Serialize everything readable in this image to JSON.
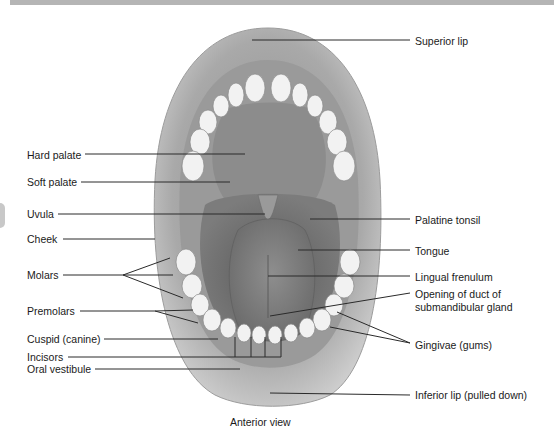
{
  "figure": {
    "caption": "Anterior view"
  },
  "labels_left": [
    {
      "id": "hard-palate",
      "text": "Hard palate"
    },
    {
      "id": "soft-palate",
      "text": "Soft palate"
    },
    {
      "id": "uvula",
      "text": "Uvula"
    },
    {
      "id": "cheek",
      "text": "Cheek"
    },
    {
      "id": "molars",
      "text": "Molars"
    },
    {
      "id": "premolars",
      "text": "Premolars"
    },
    {
      "id": "cuspid",
      "text": "Cuspid (canine)"
    },
    {
      "id": "incisors",
      "text": "Incisors"
    },
    {
      "id": "oral-vestibule",
      "text": "Oral vestibule"
    }
  ],
  "labels_right": [
    {
      "id": "superior-lip",
      "text": "Superior lip"
    },
    {
      "id": "palatine-tonsil",
      "text": "Palatine tonsil"
    },
    {
      "id": "tongue",
      "text": "Tongue"
    },
    {
      "id": "lingual-frenulum",
      "text": "Lingual frenulum"
    },
    {
      "id": "duct-opening-1",
      "text": "Opening of duct of"
    },
    {
      "id": "duct-opening-2",
      "text": "submandibular gland"
    },
    {
      "id": "gingivae",
      "text": "Gingivae (gums)"
    },
    {
      "id": "inferior-lip",
      "text": "Inferior lip (pulled down)"
    }
  ]
}
